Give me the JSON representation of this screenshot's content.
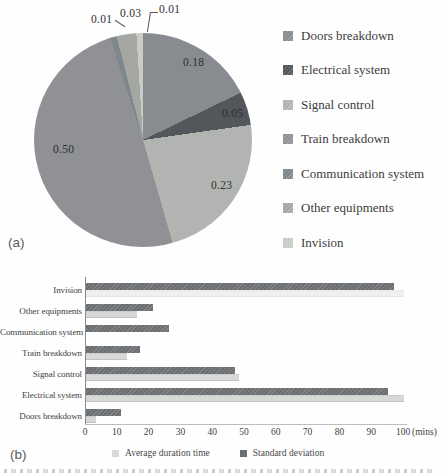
{
  "figure": {
    "panel_a_label": "(a)",
    "panel_b_label": "(b)"
  },
  "chart_data": [
    {
      "type": "pie",
      "panel": "a",
      "legend_position": "right",
      "slices": [
        {
          "label": "Doors breakdown",
          "value": 0.18,
          "display": "0.18",
          "color": "#888c90"
        },
        {
          "label": "Electrical system",
          "value": 0.05,
          "display": "0.05",
          "color": "#53565a"
        },
        {
          "label": "Signal control",
          "value": 0.23,
          "display": "0.23",
          "color": "#b2b4b1"
        },
        {
          "label": "Train breakdown",
          "value": 0.5,
          "display": "0.50",
          "color": "#8f9194"
        },
        {
          "label": "Communication system",
          "value": 0.01,
          "display": "0.01",
          "color": "#7e878b"
        },
        {
          "label": "Other equipments",
          "value": 0.03,
          "display": "0.03",
          "color": "#a5a7a2"
        },
        {
          "label": "Invision",
          "value": 0.01,
          "display": "0.01",
          "color": "#c8cbc6"
        }
      ]
    },
    {
      "type": "bar",
      "panel": "b",
      "orientation": "horizontal",
      "categories": [
        "Invision",
        "Other equipments",
        "Communication system",
        "Train breakdown",
        "Signal control",
        "Electrical system",
        "Doors breakdown"
      ],
      "series": [
        {
          "name": "Average duration time",
          "color": "#d7d9d7",
          "values": [
            100,
            16,
            0,
            13,
            48,
            100,
            3
          ],
          "row_opacity": [
            0.4,
            1,
            1,
            1,
            1,
            1,
            1
          ]
        },
        {
          "name": "Standard deviation",
          "color": "#6c6f72",
          "values": [
            97,
            21,
            26,
            17,
            47,
            95,
            11
          ],
          "row_opacity": [
            1,
            1,
            1,
            1,
            1,
            1,
            1
          ]
        }
      ],
      "xlim": [
        0,
        100
      ],
      "x_ticks": [
        0,
        10,
        20,
        30,
        40,
        50,
        60,
        70,
        80,
        90,
        100
      ],
      "x_unit": "(mins)",
      "legend_position": "bottom"
    }
  ]
}
